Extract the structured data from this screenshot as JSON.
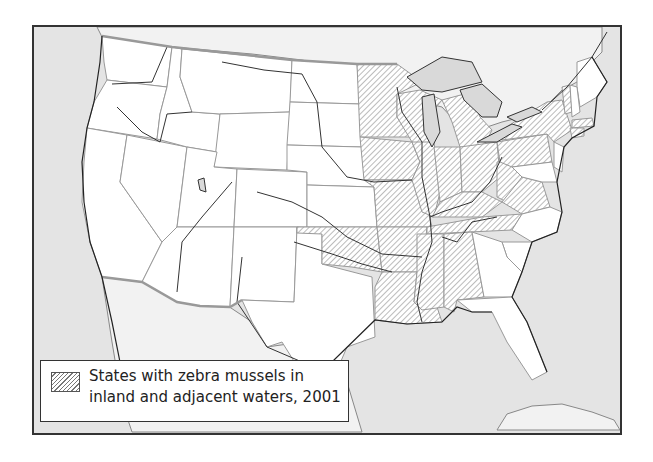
{
  "map": {
    "title": "States with zebra mussels in inland and adjacent waters, 2001",
    "colors": {
      "water": "#e4e4e4",
      "us_land": "#ffffff",
      "foreign_land": "#f2f2f2",
      "hatch": "#777777",
      "state_border": "#999999",
      "frame": "#333333"
    },
    "hatched_states": [
      "Minnesota",
      "Wisconsin",
      "Michigan",
      "Iowa",
      "Illinois",
      "Indiana",
      "Ohio",
      "Kentucky",
      "Tennessee",
      "Missouri",
      "Arkansas",
      "Louisiana",
      "Mississippi",
      "Alabama",
      "Oklahoma",
      "West Virginia",
      "Pennsylvania",
      "New York",
      "Vermont",
      "Connecticut",
      "Massachusetts",
      "Virginia"
    ],
    "unhatched_states": [
      "Washington",
      "Oregon",
      "California",
      "Idaho",
      "Nevada",
      "Montana",
      "Wyoming",
      "Utah",
      "Arizona",
      "Colorado",
      "New Mexico",
      "North Dakota",
      "South Dakota",
      "Nebraska",
      "Kansas",
      "Texas",
      "Georgia",
      "Florida",
      "South Carolina",
      "North Carolina",
      "Maine",
      "New Hampshire",
      "New Jersey",
      "Delaware",
      "Maryland"
    ]
  },
  "legend": {
    "swatch_icon": "hatch-pattern",
    "line1": "States with zebra mussels in",
    "line2": "inland and adjacent waters, 2001"
  }
}
